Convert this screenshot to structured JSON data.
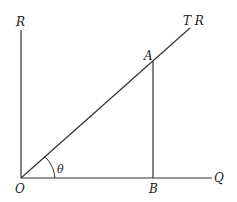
{
  "diagram": {
    "labels": {
      "R": "R",
      "TR": "T R",
      "A": "A",
      "O": "O",
      "B": "B",
      "Q": "Q",
      "theta": "θ"
    },
    "points": {
      "O": [
        21,
        178
      ],
      "R_top": [
        21,
        30
      ],
      "Q_end": [
        212,
        178
      ],
      "TR_end": [
        190,
        28
      ],
      "A": [
        153,
        61
      ],
      "B": [
        153,
        178
      ]
    },
    "line_color": "#333333"
  }
}
